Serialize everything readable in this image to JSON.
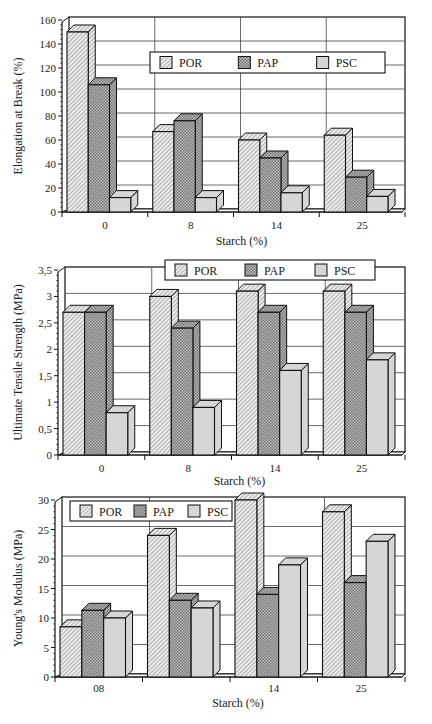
{
  "colors": {
    "POR": "#e6e6e6",
    "PAP": "#a8a8a8",
    "PSC": "#d4d4d4",
    "stroke": "#111111",
    "grid": "#444444"
  },
  "chart_data": [
    {
      "type": "bar",
      "title": "",
      "xlabel": "Starch (%)",
      "ylabel": "Elongation  at Break (%)",
      "categories": [
        "0",
        "8",
        "14",
        "25"
      ],
      "series": [
        {
          "name": "POR",
          "values": [
            150,
            67,
            60,
            64
          ]
        },
        {
          "name": "PAP",
          "values": [
            106,
            76,
            45,
            29
          ]
        },
        {
          "name": "PSC",
          "values": [
            12,
            12,
            16,
            13
          ]
        }
      ],
      "ylim": [
        0,
        160
      ],
      "yticks": [
        "0",
        "20",
        "40",
        "60",
        "80",
        "100",
        "120",
        "140",
        "160"
      ],
      "grid": true,
      "legend_position": "top-right-inside"
    },
    {
      "type": "bar",
      "title": "",
      "xlabel": "Starch (%)",
      "ylabel": "Ultimate Tensile Strength (MPa)",
      "categories": [
        "0",
        "8",
        "14",
        "25"
      ],
      "series": [
        {
          "name": "POR",
          "values": [
            2.7,
            3.0,
            3.1,
            3.1
          ]
        },
        {
          "name": "PAP",
          "values": [
            2.7,
            2.4,
            2.7,
            2.7
          ]
        },
        {
          "name": "PSC",
          "values": [
            0.8,
            0.9,
            1.6,
            1.8
          ]
        }
      ],
      "ylim": [
        0,
        3.5
      ],
      "yticks": [
        "0",
        "0,5",
        "1",
        "1,5",
        "2",
        "2,5",
        "3",
        "3,5"
      ],
      "grid": true,
      "legend_position": "top"
    },
    {
      "type": "bar",
      "title": "",
      "xlabel": "Starch (%)",
      "ylabel": "Young's Modulus (MPa)",
      "categories": [
        "08",
        "",
        "14",
        "25"
      ],
      "series": [
        {
          "name": "POR",
          "values": [
            8.5,
            24,
            30,
            28
          ]
        },
        {
          "name": "PAP",
          "values": [
            11.3,
            13,
            14,
            16
          ]
        },
        {
          "name": "PSC",
          "values": [
            10,
            11.7,
            19,
            23
          ]
        }
      ],
      "ylim": [
        0,
        30
      ],
      "yticks": [
        "0",
        "5",
        "10",
        "15",
        "20",
        "25",
        "30"
      ],
      "grid": true,
      "legend_position": "top-left-inside"
    }
  ],
  "layout": [
    {
      "x0": 62,
      "x1": 405,
      "top": 20,
      "base": 212,
      "label_y": 229,
      "xlabel_y": 245,
      "ylabel_x": 22,
      "legend": {
        "x": 150,
        "y": 52,
        "w": 235,
        "h": 21
      }
    },
    {
      "x0": 58,
      "x1": 405,
      "top": 270,
      "base": 455,
      "label_y": 472,
      "xlabel_y": 485,
      "ylabel_x": 22,
      "legend": {
        "x": 165,
        "y": 260,
        "w": 210,
        "h": 20
      }
    },
    {
      "x0": 55,
      "x1": 405,
      "top": 500,
      "base": 677,
      "label_y": 692,
      "xlabel_y": 707,
      "ylabel_x": 22,
      "legend": {
        "x": 70,
        "y": 501,
        "w": 162,
        "h": 20
      }
    }
  ]
}
